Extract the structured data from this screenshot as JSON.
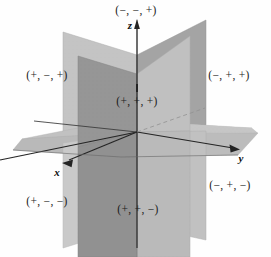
{
  "figure": {
    "width": 271,
    "height": 257,
    "background_color": "#fefefe"
  },
  "axes": [
    {
      "name": "x-axis",
      "label": "x",
      "direction": "down-left-front",
      "x": 57,
      "y": 172
    },
    {
      "name": "y-axis",
      "label": "y",
      "direction": "right",
      "x": 241,
      "y": 158
    },
    {
      "name": "z-axis",
      "label": "z",
      "direction": "up",
      "x": 130,
      "y": 25
    }
  ],
  "octant_labels": [
    {
      "name": "octant-minus-minus-plus",
      "text": "(−, −, +)",
      "x": 136,
      "y": 10
    },
    {
      "name": "octant-plus-minus-plus",
      "text": "(+, −, +)",
      "x": 47,
      "y": 75
    },
    {
      "name": "octant-minus-plus-plus",
      "text": "(−, +, +)",
      "x": 229,
      "y": 75
    },
    {
      "name": "octant-plus-plus-plus",
      "text": "(+, +, +)",
      "x": 137,
      "y": 101
    },
    {
      "name": "octant-plus-minus-minus",
      "text": "(+, −, −)",
      "x": 47,
      "y": 201
    },
    {
      "name": "octant-plus-plus-minus",
      "text": "(+, +, −)",
      "x": 138,
      "y": 209
    },
    {
      "name": "octant-minus-plus-minus",
      "text": "(−, +, −)",
      "x": 230,
      "y": 185
    }
  ],
  "planes": [
    {
      "name": "horizontal-plane-xy",
      "description": "xy-plane drawn as a parallelogram seen nearly edge-on",
      "fill": "#b9b9b9",
      "points": "10,142 118,119 261,131 148,161"
    },
    {
      "name": "back-vertical-plane-yz-light",
      "description": "Light vertical plane behind, spanning left to right",
      "fill": "#c4c4c4",
      "points": "63,32 206,20 206,240 63,248"
    },
    {
      "name": "front-vertical-plane-xz-dark",
      "description": "Dark vertical plane in front",
      "fill": "#8d8d8d",
      "points": "78,55 190,35 190,257 78,257"
    }
  ],
  "colors": {
    "plane_light": "#c4c4c4",
    "plane_mid": "#b9b9b9",
    "plane_dark": "#8d8d8d",
    "plane_darker": "#9a9a9a",
    "axis_line": "#1a1a1a",
    "text": "#1b1b1b",
    "background": "#fefefe"
  },
  "markers": [
    {
      "name": "origin-tick-mark",
      "description": "short vertical tick above the (+, +, +) label",
      "x": 137,
      "y": 88
    }
  ]
}
